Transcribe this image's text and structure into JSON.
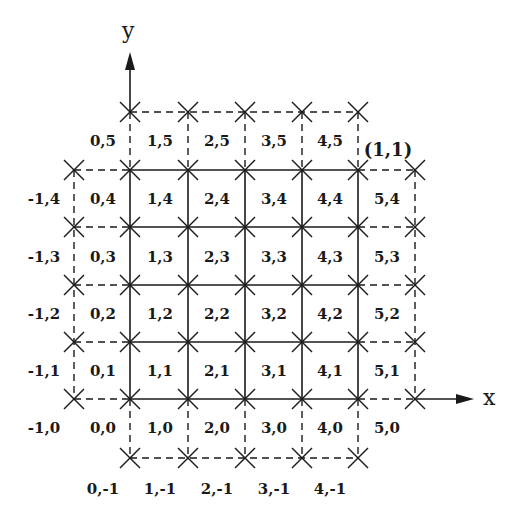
{
  "axes": {
    "x_label": "x",
    "y_label": "y"
  },
  "corner_label": "(1,1)",
  "grid": {
    "columns": [
      -1,
      0,
      1,
      2,
      3,
      4,
      5
    ],
    "rows": [
      5,
      4,
      3,
      2,
      1,
      0,
      -1
    ],
    "solid_region": {
      "cols": [
        0,
        4
      ],
      "rows": [
        0,
        4
      ]
    }
  },
  "labels": {
    "row5": [
      "0,5",
      "1,5",
      "2,5",
      "3,5",
      "4,5"
    ],
    "row4": [
      "-1,4",
      "0,4",
      "1,4",
      "2,4",
      "3,4",
      "4,4",
      "5,4"
    ],
    "row3": [
      "-1,3",
      "0,3",
      "1,3",
      "2,3",
      "3,3",
      "4,3",
      "5,3"
    ],
    "row2": [
      "-1,2",
      "0,2",
      "1,2",
      "2,2",
      "3,2",
      "4,2",
      "5,2"
    ],
    "row1": [
      "-1,1",
      "0,1",
      "1,1",
      "2,1",
      "3,1",
      "4,1",
      "5,1"
    ],
    "row0": [
      "-1,0",
      "0,0",
      "1,0",
      "2,0",
      "3,0",
      "4,0",
      "5,0"
    ],
    "rowm1": [
      "0,-1",
      "1,-1",
      "2,-1",
      "3,-1",
      "4,-1"
    ]
  },
  "colors": {
    "ink": "#1a1a1a",
    "background": "#ffffff"
  }
}
